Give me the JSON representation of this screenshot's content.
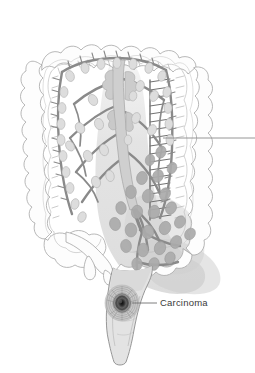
{
  "figure": {
    "type": "medical-illustration",
    "background_color": "#ffffff",
    "width": 255,
    "height": 373
  },
  "labels": [
    {
      "id": "carcinoma",
      "text": "Carcinoma",
      "x": 160,
      "y": 306,
      "leader_from": {
        "x": 132,
        "y": 303
      },
      "leader_to": {
        "x": 157,
        "y": 303
      },
      "color": "#3a3a3a"
    }
  ],
  "leader_lines": [
    {
      "id": "upper-right-unlabeled",
      "text": "",
      "from": {
        "x": 163,
        "y": 138
      },
      "to": {
        "x": 255,
        "y": 138
      },
      "color": "#8a8a8a"
    }
  ],
  "anatomy": {
    "outer_colon_wall": {
      "name": "colon-outer-wall",
      "stroke": "#a9a9a9",
      "fill": "#fdfdfd"
    },
    "inner_colon_wall": {
      "name": "colon-inner-wall",
      "stroke": "#bdbdbd",
      "fill": "none"
    },
    "serosa_line": {
      "name": "serosa-line",
      "stroke": "#c4c4c4"
    },
    "mesenteric_vessels": {
      "name": "mesenteric-vessels",
      "stroke": "#8f8f8f",
      "stroke_dark": "#7c7c7c"
    },
    "lymph_nodes_normal": {
      "name": "lymph-node",
      "fill": "#dcdcdc",
      "stroke": "#b4b4b4"
    },
    "lymph_nodes_involved": {
      "name": "metastatic-lymph-node",
      "fill": "#b0b0b0",
      "stroke": "#9a9a9a"
    },
    "drainage_shading": {
      "name": "lymphatic-drainage-territory",
      "fill": "#d5d5d5",
      "opacity": 0.55
    },
    "rectum": {
      "name": "rectum",
      "fill": "#e4e4e4",
      "stroke": "#8e8e8e"
    },
    "appendix": {
      "name": "appendix",
      "fill": "#fcfcfc",
      "stroke": "#a9a9a9"
    },
    "carcinoma_lesion": {
      "name": "carcinoma-lesion",
      "center_fill": "#1a1a1a",
      "ring_fill": "#9a9a9a",
      "outer_ring_fill": "#c0c0c0"
    }
  }
}
